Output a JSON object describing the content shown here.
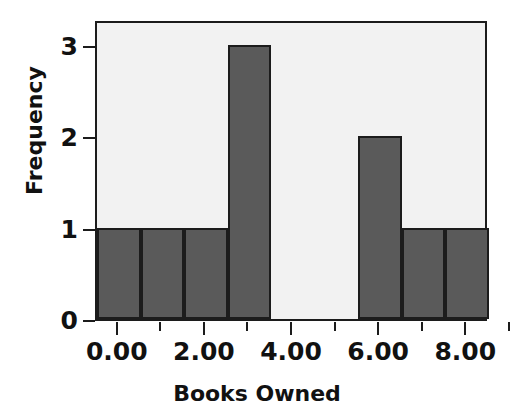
{
  "chart_data": {
    "type": "bar",
    "title": "",
    "subtitle": "",
    "xlabel": "Books Owned",
    "ylabel": "Frequency",
    "categories": [
      "0",
      "1",
      "2",
      "3",
      "4",
      "5",
      "6",
      "7",
      "8"
    ],
    "values": [
      1,
      1,
      1,
      3,
      0,
      0,
      2,
      1,
      1
    ],
    "bin_width": 1.0,
    "x": [
      0,
      1,
      2,
      3,
      4,
      5,
      6,
      7,
      8
    ],
    "xlim": [
      -0.5,
      8.5
    ],
    "ylim": [
      0,
      3.28
    ],
    "x_tick_labels": [
      "0.00",
      "2.00",
      "4.00",
      "6.00",
      "8.00"
    ],
    "x_tick_values": [
      0,
      2,
      4,
      6,
      8
    ],
    "x_minor_tick_values": [
      1,
      3,
      5,
      7
    ],
    "y_tick_labels": [
      "0",
      "1",
      "2",
      "3"
    ],
    "y_tick_values": [
      0,
      1,
      2,
      3
    ],
    "grid": false,
    "legend": false,
    "legend_position": "none",
    "bar_color": "#5a5a5a",
    "bar_edge_color": "#1c1c1c",
    "plot_background": "#f2f2f2",
    "page_background": "#ffffff",
    "axis_color": "#1c1c1c",
    "text_color": "#111111"
  },
  "axes": {
    "y": {
      "title": "Frequency",
      "ticks": [
        {
          "label": "3",
          "value": 3
        },
        {
          "label": "2",
          "value": 2
        },
        {
          "label": "1",
          "value": 1
        },
        {
          "label": "0",
          "value": 0
        }
      ]
    },
    "x": {
      "title": "Books Owned",
      "ticks": [
        {
          "label": "0.00",
          "value": 0,
          "major": true
        },
        {
          "label": "",
          "value": 1,
          "major": false
        },
        {
          "label": "2.00",
          "value": 2,
          "major": true
        },
        {
          "label": "",
          "value": 3,
          "major": false
        },
        {
          "label": "4.00",
          "value": 4,
          "major": true
        },
        {
          "label": "",
          "value": 5,
          "major": false
        },
        {
          "label": "6.00",
          "value": 6,
          "major": true
        },
        {
          "label": "",
          "value": 7,
          "major": false
        },
        {
          "label": "8.00",
          "value": 8,
          "major": true
        },
        {
          "label": "",
          "value": 9,
          "major": false
        }
      ]
    }
  },
  "bars": [
    {
      "name": "bar-0",
      "center": 0,
      "frequency": 1
    },
    {
      "name": "bar-1",
      "center": 1,
      "frequency": 1
    },
    {
      "name": "bar-2",
      "center": 2,
      "frequency": 1
    },
    {
      "name": "bar-3",
      "center": 3,
      "frequency": 3
    },
    {
      "name": "bar-4",
      "center": 4,
      "frequency": 0
    },
    {
      "name": "bar-5",
      "center": 5,
      "frequency": 0
    },
    {
      "name": "bar-6",
      "center": 6,
      "frequency": 2
    },
    {
      "name": "bar-7",
      "center": 7,
      "frequency": 1
    },
    {
      "name": "bar-8",
      "center": 8,
      "frequency": 1
    }
  ]
}
